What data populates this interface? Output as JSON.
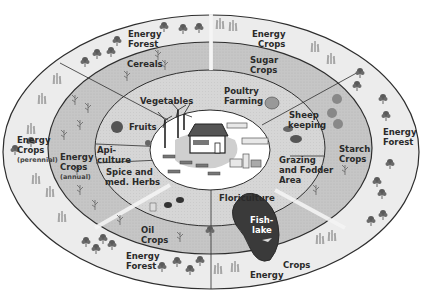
{
  "diagram": {
    "colors": {
      "outer_ring": "#ececec",
      "middle_ring": "#c9c9c9",
      "inner_ring": "#d9d9d9",
      "center": "#ffffff",
      "lines": "#2e2e2e",
      "lake": "#3a3a3a",
      "tree": "#555555"
    },
    "center": {
      "label": "Farm with wind turbines, buildings, biogas plant and solar panels"
    },
    "outer_ring": [
      {
        "id": "energy-forest-top-left",
        "lines": [
          "Energy",
          "Forest"
        ]
      },
      {
        "id": "energy-crops-top",
        "lines": [
          "Energy",
          "Crops"
        ]
      },
      {
        "id": "energy-forest-right",
        "lines": [
          "Energy",
          "Forest"
        ]
      },
      {
        "id": "energy-crops-bottom",
        "lines": [
          "Energy",
          "Crops"
        ]
      },
      {
        "id": "energy-forest-bottom-left",
        "lines": [
          "Energy",
          "Forest"
        ]
      },
      {
        "id": "energy-crops-left",
        "lines": [
          "Energy",
          "Crops",
          "(perennial)"
        ]
      }
    ],
    "middle_ring": [
      {
        "id": "cereals",
        "lines": [
          "Cereals"
        ]
      },
      {
        "id": "sugar-crops",
        "lines": [
          "Sugar",
          "Crops"
        ]
      },
      {
        "id": "starch-crops",
        "lines": [
          "Starch",
          "Crops"
        ]
      },
      {
        "id": "oil-crops",
        "lines": [
          "Oil",
          "Crops"
        ]
      },
      {
        "id": "energy-crops-annual",
        "lines": [
          "Energy",
          "Crops",
          "(annual)"
        ]
      }
    ],
    "inner_ring": [
      {
        "id": "vegetables",
        "lines": [
          "Vegetables"
        ]
      },
      {
        "id": "poultry-farming",
        "lines": [
          "Poultry",
          "Farming"
        ]
      },
      {
        "id": "sheep-keeping",
        "lines": [
          "Sheep",
          "keeping"
        ]
      },
      {
        "id": "grazing",
        "lines": [
          "Grazing",
          "and Fodder",
          "Area"
        ]
      },
      {
        "id": "floriculture",
        "lines": [
          "Floriculture"
        ]
      },
      {
        "id": "spice-herbs",
        "lines": [
          "Spice and",
          "med. Herbs"
        ]
      },
      {
        "id": "apiculture",
        "lines": [
          "Api-",
          "culture"
        ]
      },
      {
        "id": "fruits",
        "lines": [
          "Fruits"
        ]
      }
    ],
    "fish_lake": {
      "lines": [
        "Fish-",
        "lake"
      ]
    }
  }
}
